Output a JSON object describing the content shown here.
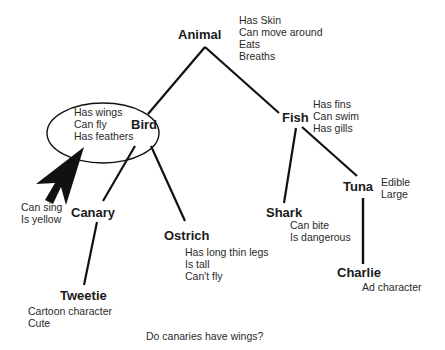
{
  "diagram": {
    "type": "semantic-network",
    "colors": {
      "line": "#111111",
      "text": "#222222",
      "background": "#ffffff"
    },
    "nodes": {
      "animal": {
        "label": "Animal",
        "properties": [
          "Has Skin",
          "Can move around",
          "Eats",
          "Breaths"
        ]
      },
      "bird": {
        "label": "Bird",
        "properties": [
          "Has wings",
          "Can fly",
          "Has feathers"
        ]
      },
      "fish": {
        "label": "Fish",
        "properties": [
          "Has fins",
          "Can swim",
          "Has gills"
        ]
      },
      "canary": {
        "label": "Canary",
        "properties": [
          "Can sing",
          "Is yellow"
        ]
      },
      "ostrich": {
        "label": "Ostrich",
        "properties": [
          "Has long thin legs",
          "Is tall",
          "Can't fly"
        ]
      },
      "shark": {
        "label": "Shark",
        "properties": [
          "Can bite",
          "Is dangerous"
        ]
      },
      "tuna": {
        "label": "Tuna",
        "properties": [
          "Edible",
          "Large"
        ]
      },
      "tweetie": {
        "label": "Tweetie",
        "properties": [
          "Cartoon character",
          "Cute"
        ]
      },
      "charlie": {
        "label": "Charlie",
        "properties": [
          "Ad character"
        ]
      }
    },
    "edges": [
      [
        "animal",
        "bird"
      ],
      [
        "animal",
        "fish"
      ],
      [
        "bird",
        "canary"
      ],
      [
        "bird",
        "ostrich"
      ],
      [
        "fish",
        "shark"
      ],
      [
        "fish",
        "tuna"
      ],
      [
        "canary",
        "tweetie"
      ],
      [
        "tuna",
        "charlie"
      ]
    ],
    "highlight": {
      "target": "bird.properties",
      "shape": "ellipse",
      "pointer": "arrow-icon"
    },
    "question": "Do canaries have wings?"
  }
}
